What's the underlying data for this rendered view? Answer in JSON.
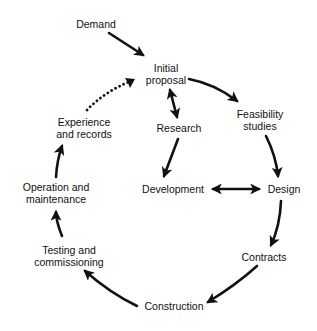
{
  "diagram": {
    "type": "cycle-flow",
    "colors": {
      "ink": "#111111",
      "background": "#ffffff"
    },
    "nodes": {
      "demand": {
        "lines": [
          "Demand"
        ]
      },
      "initial_proposal": {
        "lines": [
          "Initial",
          "proposal"
        ]
      },
      "feasibility_studies": {
        "lines": [
          "Feasibility",
          "studies"
        ]
      },
      "research": {
        "lines": [
          "Research"
        ]
      },
      "development": {
        "lines": [
          "Development"
        ]
      },
      "design": {
        "lines": [
          "Design"
        ]
      },
      "contracts": {
        "lines": [
          "Contracts"
        ]
      },
      "construction": {
        "lines": [
          "Construction"
        ]
      },
      "testing_and_commissioning": {
        "lines": [
          "Testing and",
          "commissioning"
        ]
      },
      "operation_and_maintenance": {
        "lines": [
          "Operation and",
          "maintenance"
        ]
      },
      "experience_and_records": {
        "lines": [
          "Experience",
          "and records"
        ]
      }
    },
    "edges": [
      {
        "from": "Demand",
        "to": "Initial proposal",
        "style": "solid",
        "direction": "forward"
      },
      {
        "from": "Initial proposal",
        "to": "Feasibility studies",
        "style": "solid",
        "direction": "forward"
      },
      {
        "from": "Initial proposal",
        "to": "Research",
        "style": "solid",
        "direction": "both"
      },
      {
        "from": "Research",
        "to": "Development",
        "style": "solid",
        "direction": "forward"
      },
      {
        "from": "Feasibility studies",
        "to": "Design",
        "style": "solid",
        "direction": "forward"
      },
      {
        "from": "Development",
        "to": "Design",
        "style": "solid",
        "direction": "both"
      },
      {
        "from": "Design",
        "to": "Contracts",
        "style": "solid",
        "direction": "forward"
      },
      {
        "from": "Contracts",
        "to": "Construction",
        "style": "solid",
        "direction": "forward"
      },
      {
        "from": "Construction",
        "to": "Testing and commissioning",
        "style": "solid",
        "direction": "forward"
      },
      {
        "from": "Testing and commissioning",
        "to": "Operation and maintenance",
        "style": "solid",
        "direction": "forward"
      },
      {
        "from": "Operation and maintenance",
        "to": "Experience and records",
        "style": "solid",
        "direction": "forward"
      },
      {
        "from": "Experience and records",
        "to": "Initial proposal",
        "style": "dotted",
        "direction": "forward"
      }
    ]
  }
}
